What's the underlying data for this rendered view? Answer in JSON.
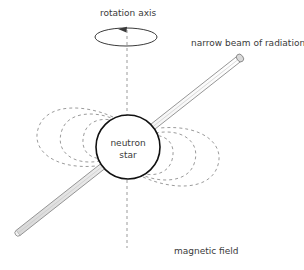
{
  "diagram": {
    "background": "#ffffff",
    "labels": {
      "rotation_axis": "rotation axis",
      "beam": "narrow beam of radiation",
      "star_line1": "neutron",
      "star_line2": "star",
      "magnetic_field": "magnetic field"
    },
    "colors": {
      "star_outline": "#111111",
      "star_fill": "#ffffff",
      "field_line": "#9b9b9b",
      "axis_line": "#9b9b9b",
      "beam_outline": "#8a8a8a",
      "beam_fill": "#f2f2f2",
      "rotation_ellipse": "#3a3a3a",
      "text": "#3a3a3a"
    },
    "star": {
      "cx": 128,
      "cy": 147,
      "r": 32,
      "stroke_width": 1.6
    },
    "rotation_axis": {
      "x": 127,
      "y_top": 30,
      "y_bottom": 248,
      "dash": "3,3",
      "stroke_width": 1
    },
    "rotation_ellipse": {
      "cx": 126,
      "cy": 37,
      "rx": 31,
      "ry": 9,
      "arrow_tip_x": 118,
      "arrow_tip_y": 29
    },
    "beam": {
      "x1": 18,
      "y1": 233,
      "x2": 240,
      "y2": 58,
      "half_width": 3.2,
      "cap_rx": 4.2,
      "cap_ry": 3.2
    },
    "field_lines_upper_left": [
      "M 113 117 C 84 104 50 104 40 124 C 28 148 52 170 96 166",
      "M 116 120 C 95 110 68 112 62 130 C 54 152 74 166 100 161",
      "M 120 123 C 106 116 88 119 84 134 C 79 152 92 161 107 158"
    ],
    "field_lines_lower_right": [
      "M 143 177 C 172 190 206 190 216 170 C 228 146 204 124 160 128",
      "M 140 174 C 161 184 188 182 194 164 C 202 142 182 128 156 133",
      "M 136 171 C 150 178 168 175 172 160 C 177 142 164 133 149 136"
    ],
    "label_positions": {
      "rotation_axis": {
        "x": 100,
        "y": 16
      },
      "beam": {
        "x": 191,
        "y": 46
      },
      "magnetic_field": {
        "x": 174,
        "y": 254
      },
      "star_line1": {
        "x": 128,
        "y": 146
      },
      "star_line2": {
        "x": 128,
        "y": 158
      }
    }
  }
}
